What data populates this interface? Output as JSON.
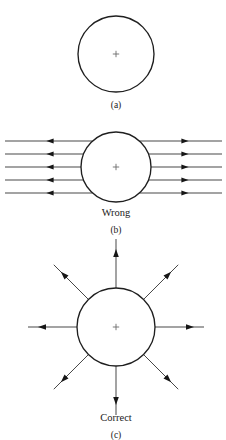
{
  "figure": {
    "background_color": "#ffffff",
    "line_color": "#262626",
    "circle_stroke_color": "#1f1f1f",
    "cross_color": "#6b6b6b",
    "width": 226,
    "height": 440
  },
  "panels": [
    {
      "id": "a",
      "label": "(a)",
      "caption": "",
      "charge_symbol": "+",
      "circle": {
        "cx": 116,
        "cy": 54,
        "r": 38
      },
      "label_position": {
        "x": 116,
        "y": 108
      },
      "field_lines": 0,
      "description": "Bare circle with a positive charge marker at its center and no field lines drawn."
    },
    {
      "id": "b",
      "label": "(b)",
      "caption": "Wrong",
      "charge_symbol": "+",
      "circle": {
        "cx": 116,
        "cy": 167,
        "r": 35
      },
      "caption_position": {
        "x": 116,
        "y": 216
      },
      "label_position": {
        "x": 116,
        "y": 233
      },
      "field_lines": 5,
      "line_y_positions": [
        141,
        154,
        167,
        180,
        193
      ],
      "left_edge_x": 5,
      "right_edge_x": 222,
      "left_arrow_x": 50,
      "right_arrow_x": 185,
      "left_arrow_direction": "left",
      "right_arrow_direction": "right",
      "description": "Five straight horizontal field lines entering and leaving the charge sideways, with arrows pointing outward to the left and to the right. This depiction is labelled Wrong."
    },
    {
      "id": "c",
      "label": "(c)",
      "caption": "Correct",
      "charge_symbol": "+",
      "circle": {
        "cx": 116,
        "cy": 327,
        "r": 39
      },
      "caption_position": {
        "x": 116,
        "y": 421
      },
      "label_position": {
        "x": 116,
        "y": 438
      },
      "field_lines": 8,
      "ray_angles_deg": [
        0,
        45,
        90,
        135,
        180,
        225,
        270,
        315
      ],
      "ray_outer_radius": 88,
      "arrow_radius": 74,
      "arrow_direction": "outward",
      "description": "Eight straight field lines radiating symmetrically outward from the charge in all directions, each tipped with an arrow pointing away from the charge. This depiction is labelled Correct."
    }
  ]
}
